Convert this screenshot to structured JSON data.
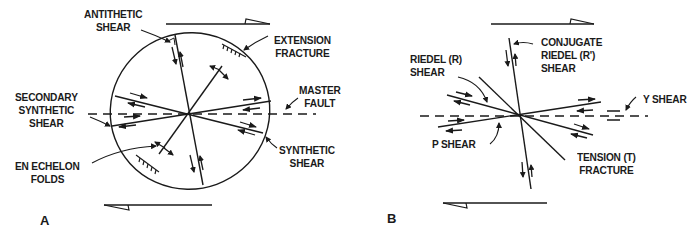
{
  "figure": {
    "panel_a": {
      "letter": "A",
      "labels": {
        "antithetic_shear": [
          "ANTITHETIC",
          "SHEAR"
        ],
        "extension_fracture": [
          "EXTENSION",
          "FRACTURE"
        ],
        "master_fault": [
          "MASTER",
          "FAULT"
        ],
        "secondary_synthetic_shear": [
          "SECONDARY",
          "SYNTHETIC",
          "SHEAR"
        ],
        "synthetic_shear": [
          "SYNTHETIC",
          "SHEAR"
        ],
        "en_echelon_folds": [
          "EN ECHELON",
          "FOLDS"
        ]
      }
    },
    "panel_b": {
      "letter": "B",
      "labels": {
        "riedel_shear": [
          "RIEDEL  (R)",
          "SHEAR"
        ],
        "conjugate_riedel_shear": [
          "CONJUGATE",
          "RIEDEL (R')",
          "SHEAR"
        ],
        "y_shear": [
          "Y SHEAR"
        ],
        "p_shear": [
          "P SHEAR"
        ],
        "tension_fracture": [
          "TENSION  (T)",
          "FRACTURE"
        ]
      }
    },
    "colors": {
      "ink": "#1a1a1a",
      "background": "#ffffff"
    }
  }
}
